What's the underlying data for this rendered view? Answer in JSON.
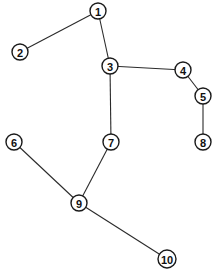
{
  "diagram": {
    "type": "tree-graph",
    "node_radius": 8,
    "colors": {
      "background": "#ffffff",
      "stroke": "#1a1a1a",
      "text": "#111111"
    },
    "nodes": [
      {
        "id": "1",
        "label": "1",
        "x": 98,
        "y": 11
      },
      {
        "id": "2",
        "label": "2",
        "x": 20,
        "y": 52
      },
      {
        "id": "3",
        "label": "3",
        "x": 110,
        "y": 66
      },
      {
        "id": "4",
        "label": "4",
        "x": 183,
        "y": 70
      },
      {
        "id": "5",
        "label": "5",
        "x": 203,
        "y": 96
      },
      {
        "id": "6",
        "label": "6",
        "x": 14,
        "y": 142
      },
      {
        "id": "7",
        "label": "7",
        "x": 111,
        "y": 142
      },
      {
        "id": "8",
        "label": "8",
        "x": 203,
        "y": 142
      },
      {
        "id": "9",
        "label": "9",
        "x": 79,
        "y": 203
      },
      {
        "id": "10",
        "label": "10",
        "x": 167,
        "y": 259
      }
    ],
    "edges": [
      {
        "from": "1",
        "to": "2"
      },
      {
        "from": "1",
        "to": "3"
      },
      {
        "from": "3",
        "to": "4"
      },
      {
        "from": "4",
        "to": "5"
      },
      {
        "from": "5",
        "to": "8"
      },
      {
        "from": "3",
        "to": "7"
      },
      {
        "from": "7",
        "to": "9"
      },
      {
        "from": "6",
        "to": "9"
      },
      {
        "from": "9",
        "to": "10"
      }
    ]
  }
}
